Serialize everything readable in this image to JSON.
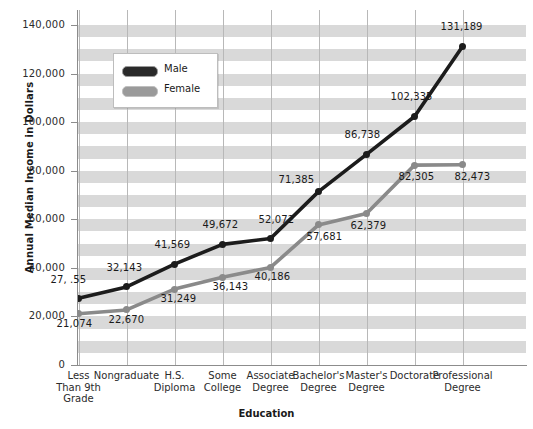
{
  "chart_data": {
    "type": "line",
    "title": "",
    "xlabel": "Education",
    "ylabel": "Annual Median Income in Dollars",
    "ylim": [
      0,
      140000
    ],
    "ytick_labels": [
      "0",
      "20,000",
      "40,000",
      "60,000",
      "80,000",
      "100,000",
      "120,000",
      "140,000"
    ],
    "ytick_values": [
      0,
      20000,
      40000,
      60000,
      80000,
      100000,
      120000,
      140000
    ],
    "grid": "horizontal-bands-and-vertical-lines",
    "legend_position": "upper-left-inside",
    "categories": [
      "Less\nThan 9th\nGrade",
      "Nongraduate",
      "H.S.\nDiploma",
      "Some\nCollege",
      "Associate\nDegree",
      "Bachelor's\nDegree",
      "Master's\nDegree",
      "Doctorate",
      "Professional\nDegree"
    ],
    "category_lines": [
      [
        "Less",
        "Than 9th",
        "Grade"
      ],
      [
        "Nongraduate"
      ],
      [
        "H.S.",
        "Diploma"
      ],
      [
        "Some",
        "College"
      ],
      [
        "Associate",
        "Degree"
      ],
      [
        "Bachelor's",
        "Degree"
      ],
      [
        "Master's",
        "Degree"
      ],
      [
        "Doctorate"
      ],
      [
        "Professional",
        "Degree"
      ]
    ],
    "series": [
      {
        "name": "Male",
        "color": "#1c1c1c",
        "values": [
          27455,
          32143,
          41569,
          49672,
          52072,
          71385,
          86738,
          102335,
          131189
        ],
        "labels": [
          "27, .55",
          "32,143",
          "41,569",
          "49,672",
          "52,072",
          "71,385",
          "86,738",
          "102,335",
          "131,189"
        ]
      },
      {
        "name": "Female",
        "color": "#8a8a8a",
        "values": [
          21074,
          22670,
          31249,
          36143,
          40186,
          57681,
          62379,
          82305,
          82473
        ],
        "labels": [
          "21,074",
          "22,670",
          "31,249",
          "36,143",
          "40,186",
          "57,681",
          "62,379",
          "82,305",
          "82,473"
        ]
      }
    ]
  },
  "legend": {
    "items": [
      {
        "label": "Male"
      },
      {
        "label": "Female"
      }
    ]
  }
}
